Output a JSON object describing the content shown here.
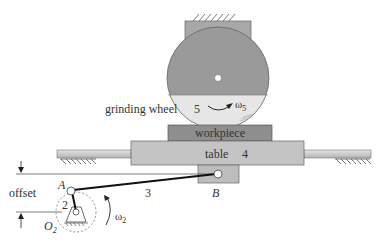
{
  "diagram": {
    "labels": {
      "grinding_wheel": "grinding wheel",
      "wheel_number": "5",
      "omega5_symbol": "ω",
      "omega5_sub": "5",
      "workpiece": "workpiece",
      "table": "table",
      "table_number": "4",
      "link_number": "3",
      "crank_number": "2",
      "point_A": "A",
      "point_B": "B",
      "pivot_symbol": "O",
      "pivot_sub": "2",
      "omega2_symbol": "ω",
      "omega2_sub": "2",
      "offset": "offset"
    },
    "colors": {
      "wheel_dark": "#9a9a9a",
      "wheel_light": "#e6e6e6",
      "mount": "#a8a8a8",
      "workpiece": "#8e8e8e",
      "table": "#c4c4c4",
      "rail": "#cfcfcf",
      "block": "#bdbdbd",
      "link": "#111111",
      "line": "#444444"
    },
    "components": [
      {
        "id": 2,
        "name": "crank"
      },
      {
        "id": 3,
        "name": "connecting rod"
      },
      {
        "id": 4,
        "name": "table"
      },
      {
        "id": 5,
        "name": "grinding wheel"
      }
    ]
  }
}
